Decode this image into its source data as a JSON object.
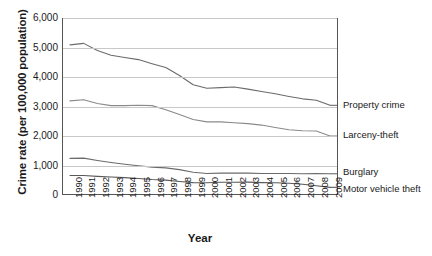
{
  "chart_data": {
    "type": "line",
    "title": "",
    "xlabel": "Year",
    "ylabel": "Crime rate (per 100,000 population)",
    "xlim": [
      1990,
      2009
    ],
    "ylim": [
      0,
      6000
    ],
    "grid": true,
    "legend_position": "right-of-plot-inline",
    "ytick_labels": [
      "6,000",
      "5,000",
      "4,000",
      "3,000",
      "2,000",
      "1,000",
      "0"
    ],
    "ytick_values": [
      6000,
      5000,
      4000,
      3000,
      2000,
      1000,
      0
    ],
    "categories": [
      "1990",
      "1991",
      "1992",
      "1993",
      "1994",
      "1995",
      "1996",
      "1997",
      "1998",
      "1999",
      "2000",
      "2001",
      "2002",
      "2003",
      "2004",
      "2005",
      "2006",
      "2007",
      "2008",
      "2009"
    ],
    "series": [
      {
        "name": "Property crime",
        "color": "#6b6b6b",
        "values": [
          5090,
          5140,
          4900,
          4740,
          4660,
          4590,
          4450,
          4320,
          4050,
          3740,
          3620,
          3640,
          3660,
          3590,
          3510,
          3430,
          3340,
          3260,
          3210,
          3040
        ]
      },
      {
        "name": "Larceny-theft",
        "color": "#8a8a8a",
        "values": [
          3190,
          3230,
          3100,
          3030,
          3030,
          3040,
          3030,
          2890,
          2730,
          2560,
          2480,
          2480,
          2450,
          2420,
          2370,
          2290,
          2210,
          2180,
          2170,
          2000
        ]
      },
      {
        "name": "Burglary",
        "color": "#6b6b6b",
        "values": [
          1240,
          1250,
          1170,
          1100,
          1040,
          990,
          945,
          920,
          860,
          770,
          730,
          740,
          740,
          740,
          730,
          730,
          730,
          720,
          730,
          720
        ]
      },
      {
        "name": "Motor vehicle theft",
        "color": "#5a5a5a",
        "values": [
          660,
          660,
          630,
          610,
          590,
          560,
          525,
          505,
          460,
          420,
          415,
          430,
          430,
          435,
          420,
          415,
          400,
          365,
          315,
          260
        ]
      }
    ]
  },
  "axis": {
    "ylabel": "Crime rate (per 100,000 population)",
    "xlabel": "Year"
  },
  "series_labels": [
    {
      "text": "Property crime"
    },
    {
      "text": "Larceny-theft"
    },
    {
      "text": "Burglary"
    },
    {
      "text": "Motor vehicle theft"
    }
  ]
}
